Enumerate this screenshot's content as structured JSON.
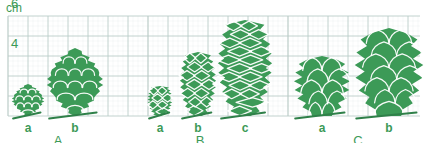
{
  "figure": {
    "axis": {
      "unit_label": "cm",
      "tick_labels": [
        "6",
        "4"
      ],
      "tick_values": [
        6,
        4
      ]
    },
    "colors": {
      "cone_fill": "#3c9a57",
      "cone_fill_dark": "#2f8049",
      "cone_outline": "#ffffff",
      "grid_line": "#b9cbc6",
      "grid_line_major": "#9fb6b1",
      "text": "#3c9a57",
      "background": "#ffffff"
    },
    "grid": {
      "cell_px": 20,
      "left_px": 8,
      "top_px": 16,
      "right_px": 420,
      "baseline_px": 116,
      "visible": true
    },
    "groups": [
      {
        "id": "A",
        "label": "A",
        "label_x": 58,
        "specimens": [
          {
            "id": "Aa",
            "label": "a",
            "label_x": 28,
            "center_x": 28,
            "height_cm": 1.6,
            "width_px": 30,
            "shape": "rounded-bud"
          },
          {
            "id": "Ab",
            "label": "b",
            "label_x": 75,
            "center_x": 75,
            "height_cm": 3.4,
            "width_px": 52,
            "shape": "rounded-bud"
          }
        ]
      },
      {
        "id": "B",
        "label": "B",
        "label_x": 200,
        "specimens": [
          {
            "id": "Ba",
            "label": "a",
            "label_x": 160,
            "center_x": 160,
            "height_cm": 1.5,
            "width_px": 22,
            "shape": "narrow-cone"
          },
          {
            "id": "Bb",
            "label": "b",
            "label_x": 198,
            "center_x": 198,
            "height_cm": 3.2,
            "width_px": 32,
            "shape": "narrow-cone"
          },
          {
            "id": "Bc",
            "label": "c",
            "label_x": 245,
            "center_x": 245,
            "height_cm": 4.8,
            "width_px": 48,
            "shape": "narrow-cone"
          }
        ]
      },
      {
        "id": "C",
        "label": "C",
        "label_x": 358,
        "specimens": [
          {
            "id": "Ca",
            "label": "a",
            "label_x": 322,
            "center_x": 322,
            "height_cm": 3.0,
            "width_px": 54,
            "shape": "leafy-bud"
          },
          {
            "id": "Cb",
            "label": "b",
            "label_x": 389,
            "center_x": 389,
            "height_cm": 4.4,
            "width_px": 66,
            "shape": "leafy-bud"
          }
        ]
      }
    ]
  }
}
